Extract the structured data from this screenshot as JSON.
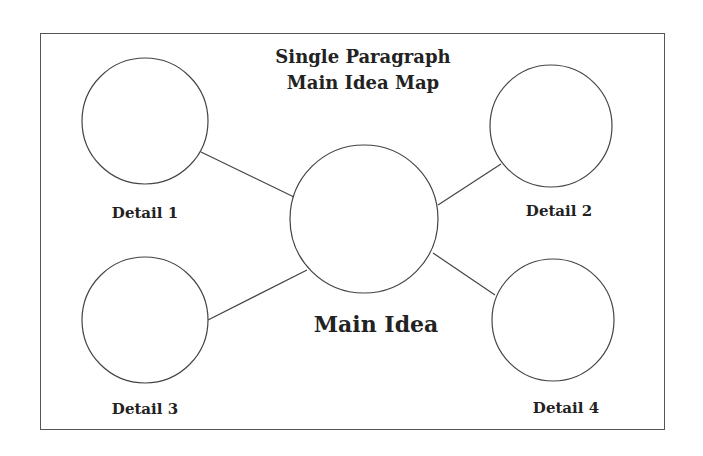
{
  "title": {
    "line1": "Single Paragraph",
    "line2": "Main Idea Map"
  },
  "main_idea": {
    "label": "Main Idea"
  },
  "details": [
    {
      "label": "Detail 1"
    },
    {
      "label": "Detail 2"
    },
    {
      "label": "Detail 3"
    },
    {
      "label": "Detail 4"
    }
  ],
  "colors": {
    "stroke": "#444444",
    "text": "#222222",
    "background": "#ffffff"
  }
}
